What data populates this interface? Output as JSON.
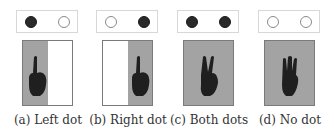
{
  "figure": {
    "panels": [
      {
        "id": "a",
        "caption": "(a) Left dot",
        "dots": [
          "filled",
          "empty"
        ],
        "screen": [
          "gray",
          "white"
        ],
        "gesture": "one-finger"
      },
      {
        "id": "b",
        "caption": "(b) Right dot",
        "dots": [
          "empty",
          "filled"
        ],
        "screen": [
          "white",
          "gray"
        ],
        "gesture": "one-finger"
      },
      {
        "id": "c",
        "caption": "(c) Both dots",
        "dots": [
          "filled",
          "filled"
        ],
        "screen": [
          "gray",
          "gray"
        ],
        "gesture": "two-fingers"
      },
      {
        "id": "d",
        "caption": "(d) No dot",
        "dots": [
          "empty",
          "empty"
        ],
        "screen": [
          "gray",
          "gray"
        ],
        "gesture": "three-fingers"
      }
    ],
    "colors": {
      "dot_filled": "#2a2a2a",
      "dot_empty_border": "#8a8a8a",
      "screen_gray": "#a3a3a3",
      "hand": "#1f1f1f"
    }
  }
}
